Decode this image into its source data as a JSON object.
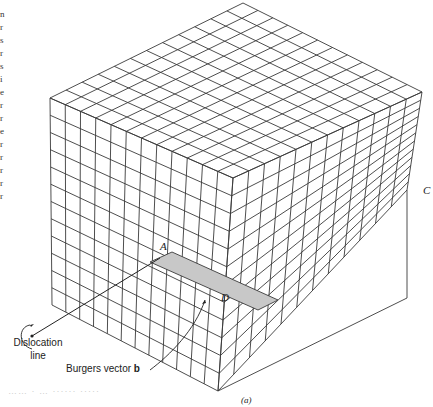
{
  "figure": {
    "caption": "(a)",
    "labels": {
      "A": "A",
      "C": "C",
      "D": "D",
      "dislocation_line_1": "Dislocation",
      "dislocation_line_2": "line",
      "burgers_prefix": "Burgers vector ",
      "burgers_b": "b"
    },
    "margin_chars": "n r s r s i e r r e r r r r r",
    "faint_text": "…… · … ······ ·····"
  },
  "colors": {
    "grid": "#3a3a3a",
    "shaded_slip": "#c8c8c8"
  }
}
